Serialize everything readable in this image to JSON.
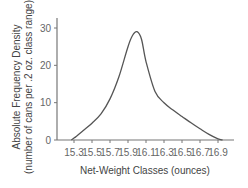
{
  "chart_data": {
    "type": "line",
    "title": "",
    "xlabel": "Net-Weight Classes (ounces)",
    "ylabel_line1": "Absolute Frequency Density",
    "ylabel_line2": "(number of cans per .2 oz. class range)",
    "ylabel": "Absolute Frequency Density (number of cans per .2 oz. class range)",
    "x_ticks": [
      "15.3",
      "15.5",
      "15.7",
      "15.9",
      "16.1",
      "16.3",
      "16.5",
      "16.7",
      "16.9"
    ],
    "y_ticks": [
      "0",
      "10",
      "20",
      "30"
    ],
    "ylim": [
      0,
      30
    ],
    "xlim": [
      15.2,
      17.0
    ],
    "grid": false,
    "legend": null,
    "series": [
      {
        "name": "frequency density",
        "x": [
          15.27,
          15.3,
          15.4,
          15.5,
          15.6,
          15.7,
          15.8,
          15.9,
          15.95,
          16.0,
          16.05,
          16.1,
          16.2,
          16.3,
          16.4,
          16.5,
          16.6,
          16.7,
          16.8,
          16.9,
          16.95
        ],
        "values": [
          0,
          0.5,
          2.5,
          4.5,
          7,
          11,
          17,
          25,
          28,
          29,
          27,
          21,
          13,
          10,
          8,
          6.3,
          4.6,
          3,
          1.5,
          0.3,
          0
        ]
      }
    ]
  }
}
